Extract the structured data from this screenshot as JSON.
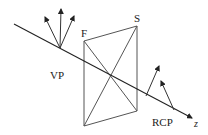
{
  "diagram": {
    "labels": {
      "input_polarization": "VP",
      "fast_axis": "F",
      "slow_axis": "S",
      "output_polarization": "RCP",
      "propagation_axis": "z"
    },
    "colors": {
      "line": "#333333",
      "plate": "#555555",
      "text": "#222222",
      "background": "#ffffff"
    }
  }
}
